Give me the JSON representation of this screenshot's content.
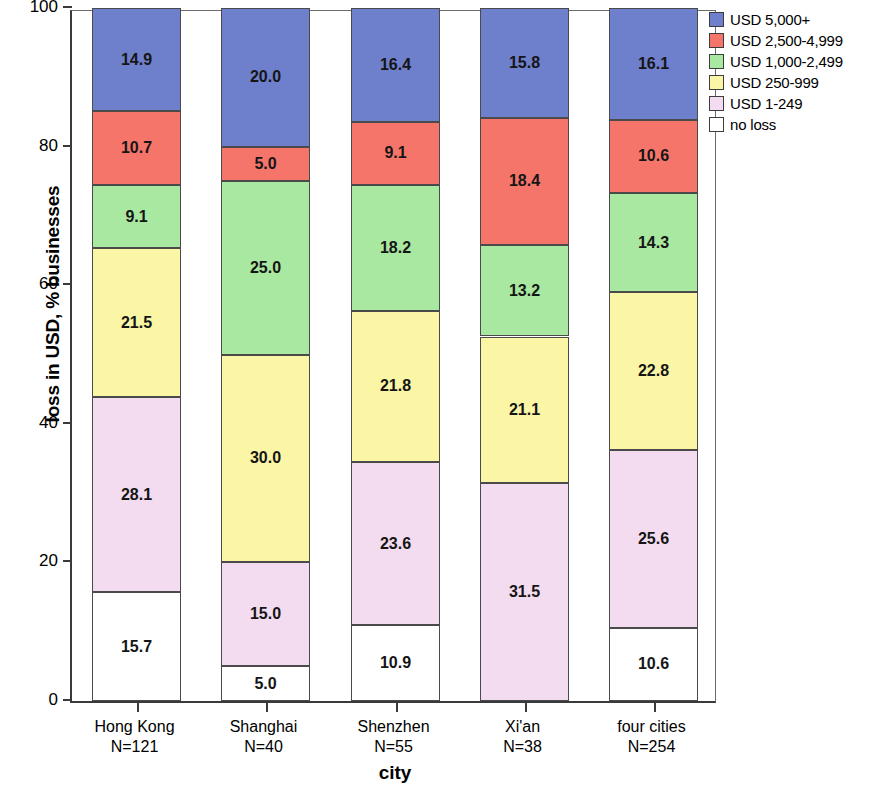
{
  "chart_data": {
    "type": "bar",
    "title": "",
    "subtitle": "",
    "stacked": true,
    "stack_total": 100,
    "xlabel": "city",
    "ylabel": "loss in USD, % businesses",
    "ylim": [
      0,
      100
    ],
    "yticks": [
      0,
      20,
      40,
      60,
      80,
      100
    ],
    "grid": false,
    "legend_position": "top-right",
    "categories": [
      "Hong Kong\nN=121",
      "Shanghai\nN=40",
      "Shenzhen\nN=55",
      "Xi'an\nN=38",
      "four cities\nN=254"
    ],
    "category_names": [
      "Hong Kong",
      "Shanghai",
      "Shenzhen",
      "Xi'an",
      "four cities"
    ],
    "category_counts": [
      "N=121",
      "N=40",
      "N=55",
      "N=38",
      "N=254"
    ],
    "series": [
      {
        "name": "no loss",
        "color": "#FFFFFF",
        "values": [
          15.7,
          5.0,
          10.9,
          0.0,
          10.6
        ]
      },
      {
        "name": "USD 1-249",
        "color": "#F3DCF0",
        "values": [
          28.1,
          15.0,
          23.6,
          31.5,
          25.6
        ]
      },
      {
        "name": "USD 250-999",
        "color": "#FAF6A6",
        "values": [
          21.5,
          30.0,
          21.8,
          21.1,
          22.8
        ]
      },
      {
        "name": "USD 1,000-2,499",
        "color": "#A9E8A0",
        "values": [
          9.1,
          25.0,
          18.2,
          13.2,
          14.3
        ]
      },
      {
        "name": "USD 2,500-4,999",
        "color": "#F5756A",
        "values": [
          10.7,
          5.0,
          9.1,
          18.4,
          10.6
        ]
      },
      {
        "name": "USD 5,000+",
        "color": "#6E7FCC",
        "values": [
          14.9,
          20.0,
          16.4,
          15.8,
          16.1
        ]
      }
    ],
    "legend_entries": [
      {
        "label": "USD 5,000+",
        "color": "#6E7FCC"
      },
      {
        "label": "USD 2,500-4,999",
        "color": "#F5756A"
      },
      {
        "label": "USD 1,000-2,499",
        "color": "#A9E8A0"
      },
      {
        "label": "USD 250-999",
        "color": "#FAF6A6"
      },
      {
        "label": "USD 1-249",
        "color": "#F3DCF0"
      },
      {
        "label": "no loss",
        "color": "#FFFFFF"
      }
    ],
    "data_labels": [
      {
        "category": "Hong Kong",
        "segments": [
          {
            "series": "USD 5,000+",
            "value": "14.9"
          },
          {
            "series": "USD 2,500-4,999",
            "value": "10.7"
          },
          {
            "series": "USD 1,000-2,499",
            "value": "9.1"
          },
          {
            "series": "USD 250-999",
            "value": "21.5"
          },
          {
            "series": "USD 1-249",
            "value": "28.1"
          },
          {
            "series": "no loss",
            "value": "15.7"
          }
        ]
      },
      {
        "category": "Shanghai",
        "segments": [
          {
            "series": "USD 5,000+",
            "value": "20.0"
          },
          {
            "series": "USD 2,500-4,999",
            "value": "5.0"
          },
          {
            "series": "USD 1,000-2,499",
            "value": "25.0"
          },
          {
            "series": "USD 250-999",
            "value": "30.0"
          },
          {
            "series": "USD 1-249",
            "value": "15.0"
          },
          {
            "series": "no loss",
            "value": "5.0"
          }
        ]
      },
      {
        "category": "Shenzhen",
        "segments": [
          {
            "series": "USD 5,000+",
            "value": "16.4"
          },
          {
            "series": "USD 2,500-4,999",
            "value": "9.1"
          },
          {
            "series": "USD 1,000-2,499",
            "value": "18.2"
          },
          {
            "series": "USD 250-999",
            "value": "21.8"
          },
          {
            "series": "USD 1-249",
            "value": "23.6"
          },
          {
            "series": "no loss",
            "value": "10.9"
          }
        ]
      },
      {
        "category": "Xi'an",
        "segments": [
          {
            "series": "USD 5,000+",
            "value": "15.8"
          },
          {
            "series": "USD 2,500-4,999",
            "value": "18.4"
          },
          {
            "series": "USD 1,000-2,499",
            "value": "13.2"
          },
          {
            "series": "USD 250-999",
            "value": "21.1"
          },
          {
            "series": "USD 1-249",
            "value": "31.5"
          }
        ]
      },
      {
        "category": "four cities",
        "segments": [
          {
            "series": "USD 5,000+",
            "value": "16.1"
          },
          {
            "series": "USD 2,500-4,999",
            "value": "10.6"
          },
          {
            "series": "USD 1,000-2,499",
            "value": "14.3"
          },
          {
            "series": "USD 250-999",
            "value": "22.8"
          },
          {
            "series": "USD 1-249",
            "value": "25.6"
          },
          {
            "series": "no loss",
            "value": "10.6"
          }
        ]
      }
    ]
  }
}
